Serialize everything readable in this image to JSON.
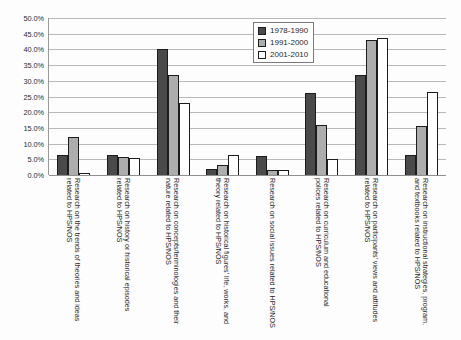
{
  "chart_data": {
    "type": "bar",
    "title": "",
    "xlabel": "",
    "ylabel": "",
    "ylim": [
      0,
      50
    ],
    "grid": true,
    "legend_position": "top-right",
    "ytick_labels": [
      "50.0%",
      "45.0%",
      "40.0%",
      "35.0%",
      "30.0%",
      "25.0%",
      "20.0%",
      "15.0%",
      "10.0%",
      "5.0%",
      "0.0%"
    ],
    "ytick_values": [
      50,
      45,
      40,
      35,
      30,
      25,
      20,
      15,
      10,
      5,
      0
    ],
    "categories": [
      "Research on the trends of theories and ideas related to HPS/NOS",
      "Research on history or historical episodes related to HPS/NOS",
      "Research on concepts/terminologies and their nature related to HPS/NOS",
      "Research on historical figures' life, works, and theory related to HPS/NOS",
      "Research on social issues related to HPS/NOS",
      "Research on curriculum and educational polices related to HPS/NOS",
      "Research on participants' views and attitudes related to HPS/NOS",
      "Research on instructional strategies, program, and textbooks related to HPS/NOS"
    ],
    "series": [
      {
        "name": "1978-1990",
        "color": "#4a4a4a",
        "values": [
          6.5,
          6.5,
          40.0,
          2.0,
          6.2,
          26.0,
          32.0,
          6.5
        ]
      },
      {
        "name": "1991-2000",
        "color": "#adadad",
        "values": [
          12.0,
          5.8,
          32.0,
          3.3,
          1.6,
          16.0,
          43.0,
          15.5
        ]
      },
      {
        "name": "2001-2010",
        "color": "#ffffff",
        "values": [
          0.7,
          5.3,
          22.8,
          6.4,
          1.6,
          5.0,
          43.5,
          26.5
        ]
      }
    ]
  }
}
